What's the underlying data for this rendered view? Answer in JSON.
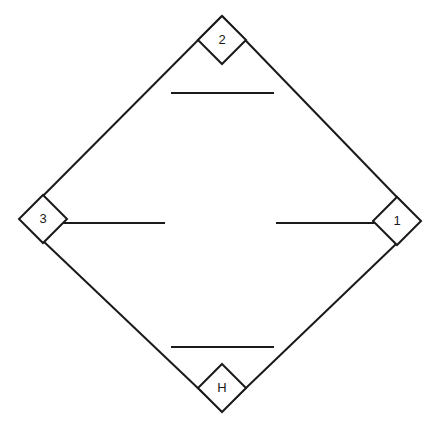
{
  "page": {
    "background_color": "#ffffff",
    "stroke_color": "#1a1a1a",
    "width": 435,
    "height": 424,
    "cropped_top_text": "· · · · · ·"
  },
  "diagram": {
    "type": "diamond-outline-with-labeled-corner-nodes",
    "outer_shape": {
      "name": "diamond",
      "vertices": [
        {
          "name": "top",
          "x": 222,
          "y": 16
        },
        {
          "name": "right",
          "x": 420,
          "y": 221
        },
        {
          "name": "bottom",
          "x": 222,
          "y": 411
        },
        {
          "name": "left",
          "x": 20,
          "y": 219
        }
      ]
    },
    "nodes": [
      {
        "id": "node-2",
        "label": "2",
        "position": "top",
        "cx": 222,
        "cy": 40,
        "rx": 24,
        "ry": 24
      },
      {
        "id": "node-1",
        "label": "1",
        "position": "right",
        "cx": 397,
        "cy": 221,
        "rx": 24,
        "ry": 24
      },
      {
        "id": "node-h",
        "label": "H",
        "position": "bottom",
        "cx": 222,
        "cy": 388,
        "rx": 24,
        "ry": 24
      },
      {
        "id": "node-3",
        "label": "3",
        "position": "left",
        "cx": 43,
        "cy": 219,
        "rx": 24,
        "ry": 24
      }
    ],
    "blank_lines": [
      {
        "id": "blank-line-top",
        "x1": 171,
        "y1": 93,
        "x2": 274,
        "y2": 93
      },
      {
        "id": "blank-line-left",
        "x1": 56,
        "y1": 223,
        "x2": 165,
        "y2": 223
      },
      {
        "id": "blank-line-right",
        "x1": 276,
        "y1": 223,
        "x2": 380,
        "y2": 223
      },
      {
        "id": "blank-line-bottom",
        "x1": 171,
        "y1": 347,
        "x2": 274,
        "y2": 347
      }
    ]
  }
}
